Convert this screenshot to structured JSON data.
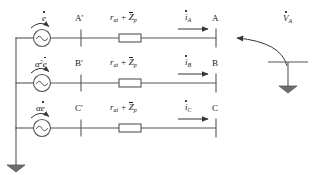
{
  "diagram": {
    "line_color": "#55575a",
    "text_color": "#1a1a1a",
    "rows": [
      {
        "source_label": "e",
        "source_prefix": "",
        "source_prefix_sup": "",
        "source_icon": "ac-source-icon",
        "arc_arrow_icon": "curved-arrow-icon",
        "left_terminal": "A′",
        "impedance_r": "r",
        "impedance_r_sub": "at",
        "impedance_plus": "+",
        "impedance_z": "Z",
        "impedance_z_sub": "p",
        "current_symbol": "i",
        "current_sub": "A",
        "right_terminal": "A"
      },
      {
        "source_label": "e",
        "source_prefix": "α",
        "source_prefix_sup": "2",
        "source_icon": "ac-source-icon",
        "arc_arrow_icon": "curved-arrow-icon",
        "left_terminal": "B′",
        "impedance_r": "r",
        "impedance_r_sub": "at",
        "impedance_plus": "+",
        "impedance_z": "Z",
        "impedance_z_sub": "p",
        "current_symbol": "i",
        "current_sub": "B",
        "right_terminal": "B"
      },
      {
        "source_label": "e",
        "source_prefix": "α",
        "source_prefix_sup": "",
        "source_icon": "ac-source-icon",
        "arc_arrow_icon": "curved-arrow-icon",
        "left_terminal": "C′",
        "impedance_r": "r",
        "impedance_r_sub": "at",
        "impedance_plus": "+",
        "impedance_z": "Z",
        "impedance_z_sub": "p",
        "current_symbol": "i",
        "current_sub": "C",
        "right_terminal": "C"
      }
    ],
    "voltage": {
      "symbol": "V",
      "sub": "A",
      "pointer_icon": "left-arrow-icon",
      "ground_icon": "ground-icon"
    },
    "neutral_ground_icon": "ground-icon"
  }
}
